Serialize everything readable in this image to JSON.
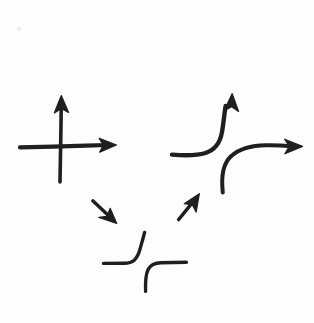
{
  "canvas": {
    "width": 314,
    "height": 323,
    "background_color": "#fdfdfd",
    "ink_color": "#1f1f1f",
    "medium": "hand-drawn pen sketch",
    "title": "Hand-drawn arrows and step curves sketch"
  },
  "shapes": [
    {
      "id": "coordinate-axes",
      "name": "coordinate-axes-crosshair",
      "description": "Cross / coordinate axes with arrowheads pointing up and right",
      "parts": {
        "vertical_line": {
          "x1": 61,
          "y1": 108,
          "x2": 60,
          "y2": 182
        },
        "horizontal_line": {
          "x1": 20,
          "y1": 147,
          "x2": 108,
          "y2": 145
        },
        "arrowhead_up": {
          "tip_x": 61,
          "tip_y": 97,
          "direction": "up"
        },
        "arrowhead_right": {
          "tip_x": 115,
          "tip_y": 145,
          "direction": "right"
        }
      }
    },
    {
      "id": "curve-up-arrow",
      "name": "curved-arrow-bending-upward",
      "description": "Horizontal stroke at left bending upward into a vertical arrow pointing up",
      "path": "M 172 154 C 196 156 214 152 220 134 C 225 118 226 110 227 104",
      "arrowhead": {
        "tip_x": 232,
        "tip_y": 95,
        "direction": "up"
      }
    },
    {
      "id": "curve-right-arrow",
      "name": "curved-arrow-bending-rightward",
      "description": "Vertical stroke at bottom bending rightward into a horizontal arrow pointing right",
      "path": "M 223 192 C 221 172 229 156 245 150 C 262 144 280 145 291 146",
      "arrowhead": {
        "tip_x": 301,
        "tip_y": 146,
        "direction": "right"
      }
    },
    {
      "id": "small-arrow-down-right",
      "name": "small-arrow-pointing-down-right",
      "description": "Short straight arrow pointing down and to the right",
      "line": {
        "x1": 93,
        "y1": 201,
        "x2": 110,
        "y2": 217
      },
      "arrowhead": {
        "tip_x": 115,
        "tip_y": 222,
        "direction": "down-right"
      }
    },
    {
      "id": "small-arrow-up-right",
      "name": "small-arrow-pointing-up-right",
      "description": "Short straight arrow pointing up and to the right",
      "line": {
        "x1": 179,
        "y1": 219,
        "x2": 194,
        "y2": 201
      },
      "arrowhead": {
        "tip_x": 198,
        "tip_y": 195,
        "direction": "up-right"
      }
    },
    {
      "id": "step-curve-rising",
      "name": "step-curve-rising-left",
      "description": "Flat horizontal stroke rising with a smooth S-bend into a vertical stroke (step up)",
      "path": "M 103 263 L 127 263 C 138 263 139 256 141 247 C 143 239 144 236 145 232"
    },
    {
      "id": "step-curve-flat",
      "name": "step-curve-rising-right",
      "description": "Vertical stroke rising with a smooth S-bend into a flat horizontal stroke (step up)",
      "path": "M 146 291 L 146 274 C 146 266 150 263 158 263 L 186 262"
    }
  ],
  "stray_marks": [
    {
      "id": "speck",
      "name": "faint-speck",
      "x": 19,
      "y": 29,
      "radius": 2.2
    }
  ]
}
